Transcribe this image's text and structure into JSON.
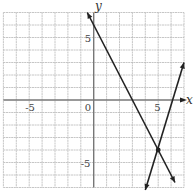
{
  "chart_data": {
    "type": "line",
    "title": "",
    "xlabel": "x",
    "ylabel": "y",
    "xlim": [
      -7,
      7
    ],
    "ylim": [
      -7,
      7
    ],
    "grid": true,
    "grid_step": 1,
    "x_tick_labels": [
      {
        "value": -5,
        "label": "-5"
      },
      {
        "value": 0,
        "label": "0"
      },
      {
        "value": 5,
        "label": "5"
      }
    ],
    "y_tick_labels": [
      {
        "value": 5,
        "label": "5"
      },
      {
        "value": -5,
        "label": "-5"
      }
    ],
    "series": [
      {
        "name": "line-1",
        "equation": "y = -2x + 6",
        "x": [
          -0.5,
          6.3
        ],
        "y": [
          7,
          -6.6
        ],
        "arrows": "both"
      },
      {
        "name": "line-2",
        "equation": "y ≈ 3.4x - 21",
        "x": [
          4.0,
          7.0
        ],
        "y": [
          -7.2,
          3.0
        ],
        "arrows": "both"
      }
    ],
    "points": [
      {
        "name": "intersection",
        "x": 5,
        "y": -4
      }
    ],
    "legend": null
  },
  "colors": {
    "grid": "#b8b8b8",
    "axis": "#777777",
    "line": "#222222",
    "background": "#ffffff"
  }
}
